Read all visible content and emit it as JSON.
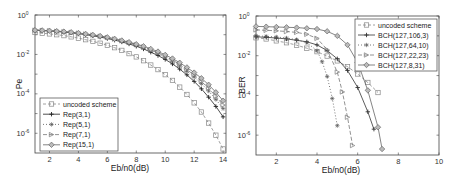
{
  "chart_data": [
    {
      "type": "line",
      "title": "",
      "xlabel": "Eb/n0(dB)",
      "ylabel": "Pe",
      "xlim": [
        1,
        14.2
      ],
      "ylim_log10": [
        -7,
        0
      ],
      "yscale": "log",
      "xticks": [
        2,
        4,
        6,
        8,
        10,
        12,
        14
      ],
      "yticks": [
        {
          "exp": "0"
        },
        {
          "exp": "-2"
        },
        {
          "exp": "-4"
        },
        {
          "exp": "-6"
        }
      ],
      "legend_position": "bottom-left",
      "x": [
        1,
        1.5,
        2,
        2.5,
        3,
        3.5,
        4,
        4.5,
        5,
        5.5,
        6,
        6.5,
        7,
        7.5,
        8,
        8.5,
        9,
        9.5,
        10,
        10.5,
        11,
        11.5,
        12,
        12.5,
        13,
        13.5,
        14
      ],
      "series": [
        {
          "name": "uncoded scheme",
          "marker": "square",
          "dash": "3,2",
          "color": "#888888",
          "values": [
            0.13,
            0.12,
            0.11,
            0.1,
            0.09,
            0.078,
            0.067,
            0.056,
            0.046,
            0.037,
            0.029,
            0.022,
            0.016,
            0.011,
            0.0075,
            0.0048,
            0.0029,
            0.0017,
            0.00094,
            0.00048,
            0.00022,
            9.3e-05,
            3.5e-05,
            1.2e-05,
            3.3e-06,
            8e-07,
            1.6e-07
          ]
        },
        {
          "name": "Rep(3,1)",
          "marker": "plus",
          "dash": "",
          "color": "#222222",
          "values": [
            0.17,
            0.16,
            0.155,
            0.145,
            0.135,
            0.125,
            0.112,
            0.1,
            0.088,
            0.076,
            0.064,
            0.053,
            0.043,
            0.034,
            0.026,
            0.019,
            0.013,
            0.0088,
            0.0056,
            0.0033,
            0.0018,
            0.00092,
            0.00043,
            0.00018,
            6.8e-05,
            2.3e-05,
            6.8e-06
          ]
        },
        {
          "name": "Rep(5,1)",
          "marker": "star",
          "dash": "1,2",
          "color": "#555555",
          "values": [
            0.17,
            0.165,
            0.158,
            0.15,
            0.14,
            0.13,
            0.118,
            0.106,
            0.094,
            0.082,
            0.07,
            0.058,
            0.047,
            0.038,
            0.029,
            0.022,
            0.016,
            0.011,
            0.0072,
            0.0045,
            0.0026,
            0.0014,
            0.00072,
            0.00033,
            0.00014,
            5.2e-05,
            1.8e-05
          ]
        },
        {
          "name": "Rep(7,1)",
          "marker": "triangle-right",
          "dash": "4,2",
          "color": "#777777",
          "values": [
            0.17,
            0.165,
            0.158,
            0.15,
            0.142,
            0.132,
            0.12,
            0.108,
            0.096,
            0.084,
            0.072,
            0.06,
            0.049,
            0.04,
            0.031,
            0.024,
            0.017,
            0.012,
            0.0082,
            0.0052,
            0.0031,
            0.0017,
            0.00089,
            0.00043,
            0.00019,
            7.5e-05,
            2.7e-05
          ]
        },
        {
          "name": "Rep(15,1)",
          "marker": "diamond",
          "dash": "",
          "color": "#666666",
          "values": [
            0.17,
            0.166,
            0.16,
            0.152,
            0.144,
            0.134,
            0.122,
            0.11,
            0.098,
            0.086,
            0.074,
            0.062,
            0.051,
            0.042,
            0.033,
            0.026,
            0.019,
            0.014,
            0.0095,
            0.0062,
            0.0038,
            0.0022,
            0.0012,
            0.00062,
            0.00029,
            0.00012,
            4.5e-05
          ]
        }
      ]
    },
    {
      "type": "line",
      "title": "",
      "xlabel": "Eb/n0(dB)",
      "ylabel": "BER",
      "xlim": [
        1,
        10
      ],
      "ylim_log10": [
        -7,
        0
      ],
      "yscale": "log",
      "xticks": [
        2,
        4,
        6,
        8,
        10
      ],
      "yticks": [
        {
          "exp": "0"
        },
        {
          "exp": "-2"
        },
        {
          "exp": "-4"
        },
        {
          "exp": "-6"
        }
      ],
      "legend_position": "top-right",
      "series": [
        {
          "name": "uncoded scheme",
          "marker": "square",
          "dash": "3,2",
          "color": "#888888",
          "x": [
            1,
            1.5,
            2,
            2.5,
            3,
            3.5,
            4,
            4.5,
            5,
            5.5,
            6,
            6.5,
            7
          ],
          "values": [
            0.08,
            0.07,
            0.056,
            0.045,
            0.034,
            0.024,
            0.016,
            0.0096,
            0.0055,
            0.0028,
            0.0012,
            0.00045,
            0.00014
          ]
        },
        {
          "name": "BCH(127,106,3)",
          "marker": "plus",
          "dash": "",
          "color": "#333333",
          "x": [
            1,
            1.5,
            2,
            2.5,
            3,
            3.5,
            4,
            4.5,
            5,
            5.5,
            6,
            6.5,
            6.8
          ],
          "values": [
            0.09,
            0.085,
            0.078,
            0.07,
            0.06,
            0.05,
            0.035,
            0.018,
            0.007,
            0.0018,
            0.00025,
            1.5e-05,
            2e-06
          ]
        },
        {
          "name": "BCH(127,64,10)",
          "marker": "star",
          "dash": "1,2",
          "color": "#555555",
          "x": [
            1,
            1.5,
            2,
            2.5,
            3,
            3.5,
            4,
            4.25,
            4.5,
            4.75,
            5
          ],
          "values": [
            0.1,
            0.095,
            0.088,
            0.078,
            0.065,
            0.045,
            0.018,
            0.005,
            0.0009,
            7e-05,
            3e-06
          ]
        },
        {
          "name": "BCH(127,22,23)",
          "marker": "triangle-right",
          "dash": "4,2",
          "color": "#777777",
          "x": [
            1,
            1.5,
            2,
            2.5,
            3,
            3.5,
            4,
            4.5,
            5,
            5.25,
            5.5,
            5.75
          ],
          "values": [
            0.2,
            0.19,
            0.18,
            0.165,
            0.15,
            0.12,
            0.075,
            0.02,
            0.0015,
            0.00015,
            8e-06,
            3e-07
          ]
        },
        {
          "name": "BCH(127,8,31)",
          "marker": "diamond",
          "dash": "",
          "color": "#666666",
          "x": [
            1,
            1.5,
            2,
            2.5,
            3,
            3.5,
            4,
            4.5,
            5,
            5.5,
            6,
            6.5,
            7,
            7.2
          ],
          "values": [
            0.3,
            0.29,
            0.28,
            0.27,
            0.26,
            0.24,
            0.22,
            0.17,
            0.1,
            0.035,
            0.0045,
            0.00018,
            2.5e-06,
            2e-07
          ]
        }
      ]
    }
  ]
}
